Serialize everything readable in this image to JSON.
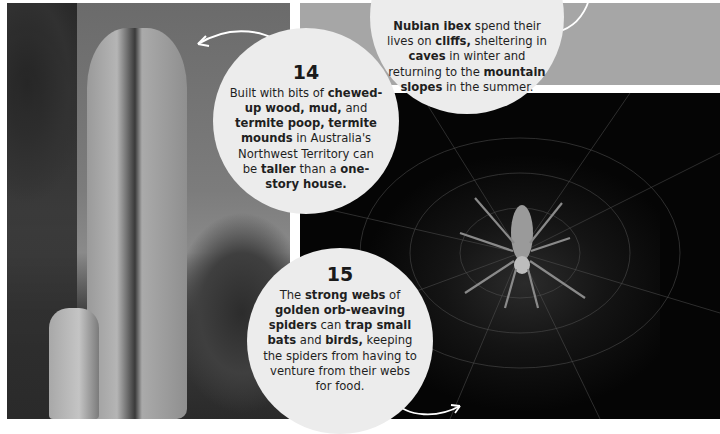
{
  "panels": {
    "left_photo": {
      "subject": "termite mound",
      "icon": "termite-mound-photo"
    },
    "top_right_photo": {
      "subject": "cliff landscape (cropped)",
      "color": "#a6a6a6"
    },
    "spider_photo": {
      "subject": "golden orb-weaving spider on web",
      "color": "#050505"
    }
  },
  "facts": [
    {
      "number": "14",
      "segments": [
        {
          "text": "Built with bits of ",
          "bold": false
        },
        {
          "text": "chewed-up wood, mud,",
          "bold": true
        },
        {
          "text": " and ",
          "bold": false
        },
        {
          "text": "termite poop,",
          "bold": true
        },
        {
          "text": " ",
          "bold": false
        },
        {
          "text": "termite mounds",
          "bold": true
        },
        {
          "text": " in Australia's Northwest Territory can be ",
          "bold": false
        },
        {
          "text": "taller",
          "bold": true
        },
        {
          "text": " than a ",
          "bold": false
        },
        {
          "text": "one-story house.",
          "bold": true
        }
      ]
    },
    {
      "number": "",
      "segments": [
        {
          "text": "Nubian ibex",
          "bold": true
        },
        {
          "text": " spend their lives on ",
          "bold": false
        },
        {
          "text": "cliffs,",
          "bold": true
        },
        {
          "text": " sheltering in ",
          "bold": false
        },
        {
          "text": "caves",
          "bold": true
        },
        {
          "text": " in winter and returning to the ",
          "bold": false
        },
        {
          "text": "mountain slopes",
          "bold": true
        },
        {
          "text": " in the summer.",
          "bold": false
        }
      ]
    },
    {
      "number": "15",
      "segments": [
        {
          "text": "The ",
          "bold": false
        },
        {
          "text": "strong webs",
          "bold": true
        },
        {
          "text": " of ",
          "bold": false
        },
        {
          "text": "golden orb-weaving spiders",
          "bold": true
        },
        {
          "text": " can ",
          "bold": false
        },
        {
          "text": "trap small bats",
          "bold": true
        },
        {
          "text": " and ",
          "bold": false
        },
        {
          "text": "birds,",
          "bold": true
        },
        {
          "text": " keeping the spiders from having to venture from their webs for food.",
          "bold": false
        }
      ]
    }
  ],
  "colors": {
    "callout_bg": "#ececec",
    "text": "#1f1f1f",
    "arrow": "#ffffff"
  }
}
